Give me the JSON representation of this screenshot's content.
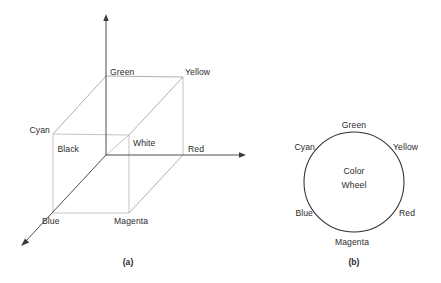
{
  "figure": {
    "background_color": "#ffffff",
    "line_color": "#3a3a3a",
    "text_color": "#2b2b2b"
  },
  "panel_a": {
    "caption": "(a)",
    "description": "RGB color cube shown in 3D axonometric projection",
    "axes": {
      "vertical_label": "",
      "horizontal_label": "",
      "diagonal_label": ""
    },
    "vertices": [
      {
        "name": "black",
        "label": "Black",
        "x": 106,
        "y": 155,
        "label_x": 79,
        "label_y": 152
      },
      {
        "name": "green",
        "label": "Green",
        "x": 106,
        "y": 76,
        "label_x": 110,
        "label_y": 75
      },
      {
        "name": "yellow",
        "label": "Yellow",
        "x": 183,
        "y": 77,
        "label_x": 185,
        "label_y": 75
      },
      {
        "name": "cyan",
        "label": "Cyan",
        "x": 53,
        "y": 134,
        "label_x": 26,
        "label_y": 133
      },
      {
        "name": "white",
        "label": "White",
        "x": 129,
        "y": 135,
        "label_x": 133,
        "label_y": 145
      },
      {
        "name": "red",
        "label": "Red",
        "x": 183,
        "y": 155,
        "label_x": 186,
        "label_y": 152
      },
      {
        "name": "blue",
        "label": "Blue",
        "x": 53,
        "y": 213,
        "label_x": 40,
        "label_y": 224
      },
      {
        "name": "magenta",
        "label": "Magenta",
        "x": 129,
        "y": 213,
        "label_x": 114,
        "label_y": 224
      }
    ]
  },
  "panel_b": {
    "caption": "(b)",
    "center_text_line1": "Color",
    "center_text_line2": "Wheel",
    "circle": {
      "cx": 354,
      "cy": 182,
      "r": 50
    },
    "labels": [
      {
        "name": "green",
        "label": "Green",
        "x": 354,
        "y": 128,
        "anchor": "middle"
      },
      {
        "name": "yellow",
        "label": "Yellow",
        "x": 396,
        "y": 150,
        "anchor": "start"
      },
      {
        "name": "red",
        "label": "Red",
        "x": 400,
        "y": 215,
        "anchor": "start"
      },
      {
        "name": "magenta",
        "label": "Magenta",
        "x": 354,
        "y": 243,
        "anchor": "middle"
      },
      {
        "name": "blue",
        "label": "Blue",
        "x": 311,
        "y": 215,
        "anchor": "end"
      },
      {
        "name": "cyan",
        "label": "Cyan",
        "x": 313,
        "y": 150,
        "anchor": "end"
      }
    ]
  }
}
